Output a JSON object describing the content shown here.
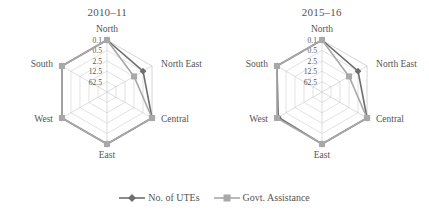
{
  "figure": {
    "background_color": "#ffffff"
  },
  "legend": {
    "position": "bottom-center",
    "entries": [
      {
        "label": "No. of UTEs",
        "marker": "diamond-marker",
        "color": "#6e6e6e"
      },
      {
        "label": "Govt. Assistance",
        "marker": "square-marker",
        "color": "#a8a8a8"
      }
    ]
  },
  "chart_data": [
    {
      "type": "radar",
      "title": "2010–11",
      "xlabel": "",
      "ylabel": "",
      "grid": true,
      "rings": 5,
      "scale": "log",
      "categories": [
        "North",
        "North East",
        "Central",
        "East",
        "West",
        "South"
      ],
      "tick_labels": [
        "0.1",
        "0.5",
        "2.5",
        "12.5",
        "62.5"
      ],
      "tick_values": [
        0.1,
        0.5,
        2.5,
        12.5,
        62.5
      ],
      "rlim": [
        0.1,
        62.5
      ],
      "series": [
        {
          "name": "No. of UTEs",
          "color": "#6e6e6e",
          "marker": "diamond-marker",
          "values": [
            62.5,
            12.5,
            62.5,
            62.5,
            62.5,
            62.5
          ]
        },
        {
          "name": "Govt. Assistance",
          "color": "#a8a8a8",
          "marker": "square-marker",
          "values": [
            62.5,
            2.5,
            62.5,
            62.5,
            62.5,
            62.5
          ]
        }
      ]
    },
    {
      "type": "radar",
      "title": "2015–16",
      "xlabel": "",
      "ylabel": "",
      "grid": true,
      "rings": 5,
      "scale": "log",
      "categories": [
        "North",
        "North East",
        "Central",
        "East",
        "West",
        "South"
      ],
      "tick_labels": [
        "0.1",
        "0.5",
        "2.5",
        "12.5",
        "62.5"
      ],
      "tick_values": [
        0.1,
        0.5,
        2.5,
        12.5,
        62.5
      ],
      "rlim": [
        0.1,
        62.5
      ],
      "series": [
        {
          "name": "No. of UTEs",
          "color": "#6e6e6e",
          "marker": "diamond-marker",
          "values": [
            62.5,
            12.5,
            62.5,
            62.5,
            50.0,
            62.5
          ]
        },
        {
          "name": "Govt. Assistance",
          "color": "#a8a8a8",
          "marker": "square-marker",
          "values": [
            62.5,
            2.5,
            62.5,
            62.5,
            62.5,
            62.5
          ]
        }
      ]
    }
  ]
}
